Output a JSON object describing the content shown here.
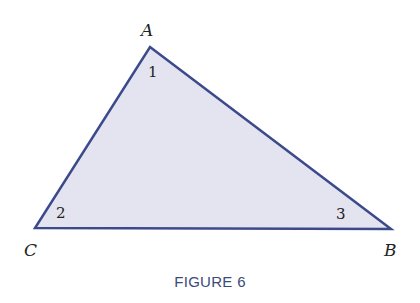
{
  "figure": {
    "caption": "FIGURE 6",
    "triangle": {
      "fill": "#e3e4f0",
      "stroke": "#3c4a8c",
      "vertices": {
        "A": {
          "label": "A",
          "x": 150,
          "y": 47
        },
        "B": {
          "label": "B",
          "x": 391,
          "y": 229
        },
        "C": {
          "label": "C",
          "x": 35,
          "y": 228
        }
      },
      "angles": [
        {
          "label": "1",
          "vertex": "A"
        },
        {
          "label": "2",
          "vertex": "C"
        },
        {
          "label": "3",
          "vertex": "B"
        }
      ]
    }
  }
}
